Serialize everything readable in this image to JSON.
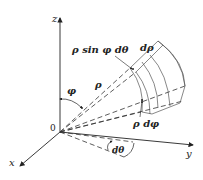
{
  "diagram": {
    "axes": {
      "z_label": "z",
      "y_label": "y",
      "x_label": "x",
      "origin_label": "0"
    },
    "labels": {
      "rho_sin_phi_dtheta": "ρ sin φ dθ",
      "d_rho": "dρ",
      "phi": "φ",
      "rho": "ρ",
      "rho_d_phi": "ρ dφ",
      "d_theta": "dθ"
    },
    "colors": {
      "ink": "#222222",
      "light_ink": "#777777",
      "background": "#ffffff"
    }
  }
}
